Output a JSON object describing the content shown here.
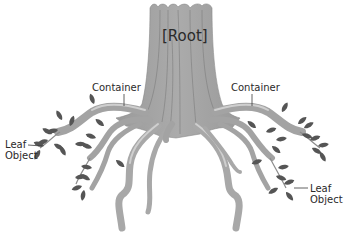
{
  "diagram": {
    "type": "tree-root-hierarchy",
    "root": {
      "label": "[Root]"
    },
    "containers": [
      {
        "label": "Container",
        "side": "left"
      },
      {
        "label": "Container",
        "side": "right"
      }
    ],
    "leaves": [
      {
        "line1": "Leaf",
        "line2": "Object",
        "side": "left"
      },
      {
        "line1": "Leaf",
        "line2": "Object",
        "side": "right"
      }
    ],
    "colors": {
      "trunk": "#a3a3a3",
      "trunk_highlight": "#c8c8c8",
      "trunk_line": "#7c7c7c",
      "leaf": "#555555",
      "text": "#2a2a2a",
      "background": "#ffffff"
    }
  }
}
